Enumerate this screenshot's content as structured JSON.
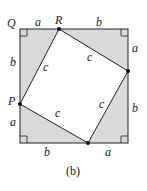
{
  "figure": {
    "caption": "(b)",
    "colors": {
      "shade": "#d9d9d9",
      "stroke": "#222222",
      "background": "#ffffff"
    },
    "points": {
      "Q": "Q",
      "R": "R",
      "P": "P"
    },
    "side_labels": {
      "top_left": "a",
      "top_right": "b",
      "right_top": "a",
      "right_bottom": "b",
      "bottom_left": "b",
      "bottom_right": "a",
      "left_top": "b",
      "left_bottom": "a"
    },
    "hypotenuse_labels": {
      "left": "c",
      "top": "c",
      "right": "c",
      "bottom": "c"
    }
  }
}
